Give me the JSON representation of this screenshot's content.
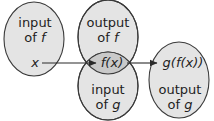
{
  "colors": {
    "fill": "#e4e4e4",
    "overlap_fill": "#c9c9c9",
    "stroke": "#3a3a3a",
    "text": "#1e1e1e",
    "background": "#ffffff"
  },
  "regions": {
    "input_f": {
      "line1": "input",
      "line2_prefix": "of ",
      "line2_var": "f"
    },
    "output_f": {
      "line1": "output",
      "line2_prefix": "of ",
      "line2_var": "f"
    },
    "input_g": {
      "line1": "input",
      "line2_prefix": "of ",
      "line2_var": "g"
    },
    "output_g": {
      "line1": "output",
      "line2_prefix": "of ",
      "line2_var": "g"
    }
  },
  "points": {
    "x": "x",
    "fx": "f(x)",
    "gfx": "g(f(x))"
  },
  "arrows": [
    {
      "from": "x",
      "to": "f(x)"
    },
    {
      "from": "f(x)",
      "to": "g(f(x))"
    }
  ]
}
